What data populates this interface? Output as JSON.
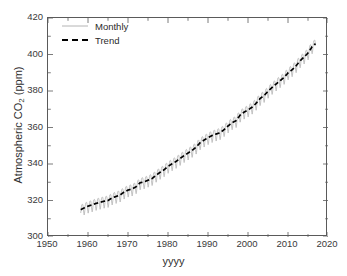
{
  "chart_data": {
    "type": "line",
    "title": "",
    "xlabel": "yyyy",
    "ylabel": "Atmospheric CO2 (ppm)",
    "ylabel_parts": {
      "pre": "Atmospheric CO",
      "sub": "2",
      "post": " (ppm)"
    },
    "xlim": [
      1950,
      2020
    ],
    "ylim": [
      300,
      420
    ],
    "xticks": [
      1950,
      1960,
      1970,
      1980,
      1990,
      2000,
      2010,
      2020
    ],
    "yticks": [
      300,
      320,
      340,
      360,
      380,
      400,
      420
    ],
    "xtick_labels": [
      "1950",
      "1960",
      "1970",
      "1980",
      "1990",
      "2000",
      "2010",
      "2020"
    ],
    "ytick_labels": [
      "300",
      "320",
      "340",
      "360",
      "380",
      "400",
      "420"
    ],
    "x_minor_step": 5,
    "y_minor_step": 10,
    "grid": false,
    "legend_position": "upper left",
    "legend": [
      {
        "name": "Monthly",
        "style": "solid",
        "color": "#b4b4b4",
        "width": 0.8
      },
      {
        "name": "Trend",
        "style": "dashed",
        "color": "#000000",
        "width": 1.7
      }
    ],
    "series": [
      {
        "name": "Trend",
        "style": "dashed",
        "color": "#000000",
        "x": [
          1958.2,
          1959,
          1960,
          1961,
          1962,
          1963,
          1964,
          1965,
          1966,
          1967,
          1968,
          1969,
          1970,
          1971,
          1972,
          1973,
          1974,
          1975,
          1976,
          1977,
          1978,
          1979,
          1980,
          1981,
          1982,
          1983,
          1984,
          1985,
          1986,
          1987,
          1988,
          1989,
          1990,
          1991,
          1992,
          1993,
          1994,
          1995,
          1996,
          1997,
          1998,
          1999,
          2000,
          2001,
          2002,
          2003,
          2004,
          2005,
          2006,
          2007,
          2008,
          2009,
          2010,
          2011,
          2012,
          2013,
          2014,
          2015,
          2016,
          2016.9
        ],
        "values": [
          315.0,
          315.9,
          316.9,
          317.6,
          318.4,
          319.0,
          319.6,
          320.0,
          321.4,
          322.2,
          323.0,
          324.6,
          325.7,
          326.3,
          327.5,
          329.7,
          330.2,
          331.1,
          332.0,
          333.8,
          335.4,
          336.8,
          338.7,
          340.1,
          341.4,
          343.0,
          344.6,
          346.0,
          347.4,
          349.2,
          351.6,
          353.1,
          354.4,
          355.6,
          356.4,
          357.1,
          358.8,
          360.8,
          362.6,
          363.7,
          366.7,
          368.4,
          369.6,
          371.1,
          373.2,
          375.8,
          377.5,
          379.8,
          381.9,
          383.8,
          385.6,
          387.4,
          389.9,
          391.6,
          393.8,
          396.5,
          398.6,
          400.8,
          404.2,
          406.0
        ]
      },
      {
        "name": "Monthly",
        "style": "solid",
        "color": "#b4b4b4",
        "seasonal_amplitude": 3.2,
        "note": "monthly values = trend + seasonal sinusoid peaking in May, trough in September"
      }
    ],
    "annotations": [],
    "data_start_year": 1958,
    "data_end_year": 2017,
    "data_start_value": 315.0,
    "data_end_value": 406.0
  }
}
